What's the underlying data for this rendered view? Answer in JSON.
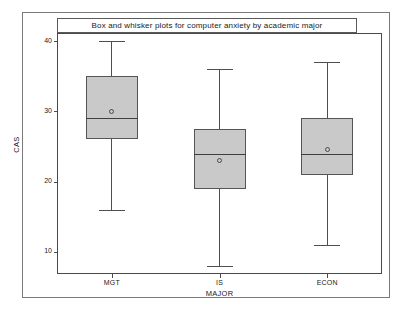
{
  "chart_data": {
    "type": "box",
    "title": "Box and whisker plots for computer anxiety by academic major",
    "xlabel": "MAJOR",
    "ylabel": "CAS",
    "categories": [
      "MGT",
      "IS",
      "ECON"
    ],
    "ylim": [
      7,
      41
    ],
    "yticks": [
      10,
      20,
      30,
      40
    ],
    "ytick_labels": [
      "10",
      "20",
      "30",
      "40"
    ],
    "grid": false,
    "legend": "none",
    "boxes": [
      {
        "category": "MGT",
        "whisker_low": 16,
        "q1": 26,
        "median": 29,
        "q3": 35,
        "whisker_high": 40,
        "mean": 30
      },
      {
        "category": "IS",
        "whisker_low": 8,
        "q1": 19,
        "median": 24,
        "q3": 27.5,
        "whisker_high": 36,
        "mean": 23
      },
      {
        "category": "ECON",
        "whisker_low": 11,
        "q1": 21,
        "median": 24,
        "q3": 29,
        "whisker_high": 37,
        "mean": 24.5
      }
    ],
    "colors": {
      "box_fill": "#c9c9c9",
      "box_border": "#555555",
      "whisker": "#4f4f4f",
      "median": "#3f3f3f",
      "axis": "#4a4a4a",
      "text": "#1a1a1a",
      "background": "#ffffff"
    }
  }
}
